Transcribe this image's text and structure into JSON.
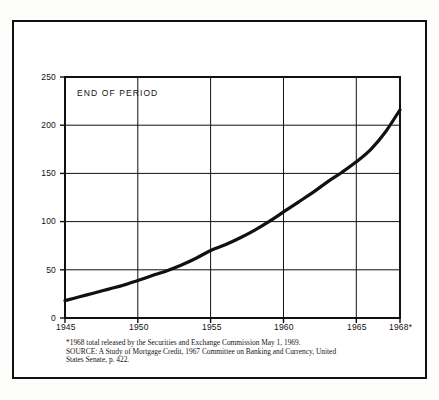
{
  "figure": {
    "inline_label": "END OF PERIOD",
    "footnotes": {
      "line1": "*1968 total released by the Securities and Exchange Commission May 1, 1969.",
      "line2": "SOURCE: A Study of Mortgage Credit, 1967 Committee on Banking and Currency, United",
      "line3": "States Senate, p. 422."
    }
  },
  "chart_data": {
    "type": "line",
    "title": "",
    "subtitle": "",
    "annotations": [
      "END OF PERIOD"
    ],
    "xlabel": "",
    "ylabel": "",
    "xlim": [
      1945,
      1968
    ],
    "ylim": [
      0,
      250
    ],
    "grid": true,
    "legend": false,
    "xticks": [
      1945,
      1950,
      1955,
      1960,
      1965,
      1968
    ],
    "xticklabels": [
      "1945",
      "1950",
      "1955",
      "1960",
      "1965",
      "1968*"
    ],
    "yticks": [
      0,
      50,
      100,
      150,
      200,
      250
    ],
    "yticklabels": [
      "0",
      "50",
      "100",
      "150",
      "200",
      "250"
    ],
    "series": [
      {
        "name": "End of period total",
        "color": "#111111",
        "x": [
          1945,
          1946,
          1947,
          1948,
          1949,
          1950,
          1951,
          1952,
          1953,
          1954,
          1955,
          1956,
          1957,
          1958,
          1959,
          1960,
          1961,
          1962,
          1963,
          1964,
          1965,
          1966,
          1967,
          1968
        ],
        "values": [
          18,
          22,
          26,
          30,
          34,
          39,
          44,
          49,
          55,
          62,
          70,
          76,
          83,
          91,
          100,
          110,
          120,
          130,
          141,
          151,
          162,
          175,
          193,
          216
        ]
      }
    ]
  }
}
